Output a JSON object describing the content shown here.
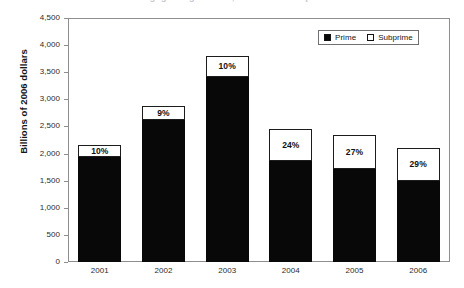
{
  "chart_data": {
    "type": "bar",
    "subtype": "stacked",
    "title": "Mortgage Originations, Prime and Subprime",
    "title_clipped": true,
    "xlabel": "",
    "ylabel": "Billions of 2006 dollars",
    "categories": [
      "2001",
      "2002",
      "2003",
      "2004",
      "2005",
      "2006"
    ],
    "ylim": [
      0,
      4500
    ],
    "ytick_values": [
      0,
      500,
      1000,
      1500,
      2000,
      2500,
      3000,
      3500,
      4000,
      4500
    ],
    "ytick_labels": [
      "0",
      "500",
      "1,000",
      "1,500",
      "2,000",
      "2,500",
      "3,000",
      "3,500",
      "4,000",
      "4,500"
    ],
    "grid": false,
    "legend_position": "top-right",
    "series": [
      {
        "name": "Prime",
        "color": "#080808",
        "values": [
          1940,
          2620,
          3420,
          1860,
          1710,
          1500
        ]
      },
      {
        "name": "Subprime",
        "color": "#ffffff",
        "values": [
          215,
          260,
          380,
          590,
          630,
          610
        ]
      }
    ],
    "totals": [
      2155,
      2880,
      3800,
      2450,
      2340,
      2110
    ],
    "data_labels": [
      "10%",
      "9%",
      "10%",
      "24%",
      "27%",
      "29%"
    ],
    "data_label_meaning": "Subprime share of total originations"
  },
  "legend": {
    "items": [
      {
        "label": "Prime",
        "swatch": "filled-square-icon"
      },
      {
        "label": "Subprime",
        "swatch": "hollow-square-icon"
      }
    ]
  }
}
